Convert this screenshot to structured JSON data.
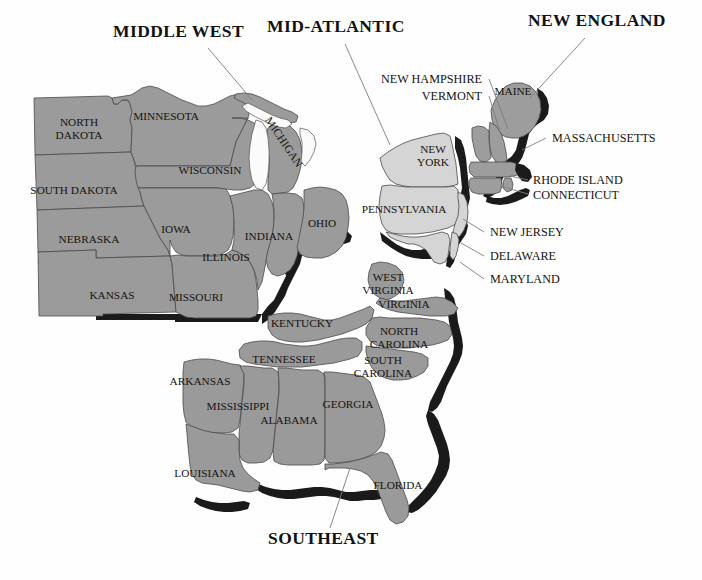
{
  "map": {
    "title_font_note": "serif bold uppercase",
    "background_color": "#fefefe",
    "region_fill_colors": {
      "middle_west": "#9b9b9b",
      "mid_atlantic": "#d5d5d5",
      "new_england": "#9d9d9d",
      "southeast": "#9a9a9a",
      "drop_shadow": "#1a1a1a",
      "great_lakes": "#fbfbfb",
      "border_stroke": "#4a4a4a"
    },
    "regions": [
      {
        "id": "middle-west",
        "label": "MIDDLE WEST",
        "x": 113,
        "y": 37,
        "anchor": "start"
      },
      {
        "id": "mid-atlantic",
        "label": "MID-ATLANTIC",
        "x": 267,
        "y": 32,
        "anchor": "start"
      },
      {
        "id": "new-england",
        "label": "NEW ENGLAND",
        "x": 528,
        "y": 26,
        "anchor": "start"
      },
      {
        "id": "southeast",
        "label": "SOUTHEAST",
        "x": 268,
        "y": 544,
        "anchor": "start"
      }
    ],
    "region_leaders": [
      {
        "id": "leader-middle-west",
        "x1": 208,
        "y1": 48,
        "x2": 252,
        "y2": 100
      },
      {
        "id": "leader-mid-atlantic",
        "x1": 345,
        "y1": 44,
        "x2": 390,
        "y2": 145
      },
      {
        "id": "leader-new-england",
        "x1": 585,
        "y1": 38,
        "x2": 530,
        "y2": 98
      },
      {
        "id": "leader-southeast",
        "x1": 330,
        "y1": 528,
        "x2": 350,
        "y2": 468
      }
    ],
    "state_labels": [
      {
        "id": "north-dakota",
        "lines": [
          "NORTH",
          "DAKOTA"
        ],
        "x": 79,
        "y": 126
      },
      {
        "id": "south-dakota",
        "lines": [
          "SOUTH DAKOTA"
        ],
        "x": 74,
        "y": 194
      },
      {
        "id": "nebraska",
        "lines": [
          "NEBRASKA"
        ],
        "x": 89,
        "y": 243
      },
      {
        "id": "kansas",
        "lines": [
          "KANSAS"
        ],
        "x": 112,
        "y": 299
      },
      {
        "id": "minnesota",
        "lines": [
          "MINNESOTA"
        ],
        "x": 166,
        "y": 120
      },
      {
        "id": "wisconsin",
        "lines": [
          "WISCONSIN"
        ],
        "x": 210,
        "y": 174
      },
      {
        "id": "iowa",
        "lines": [
          "IOWA"
        ],
        "x": 176,
        "y": 233
      },
      {
        "id": "missouri",
        "lines": [
          "MISSOURI"
        ],
        "x": 196,
        "y": 301
      },
      {
        "id": "illinois",
        "lines": [
          "ILLINOIS"
        ],
        "x": 226,
        "y": 261
      },
      {
        "id": "indiana",
        "lines": [
          "INDIANA"
        ],
        "x": 269,
        "y": 240
      },
      {
        "id": "ohio",
        "lines": [
          "OHIO"
        ],
        "x": 322,
        "y": 227
      },
      {
        "id": "michigan",
        "lines": [
          "MICHIGAN"
        ],
        "x": 281,
        "y": 144,
        "rotate": 56
      },
      {
        "id": "new-york",
        "lines": [
          "NEW",
          "YORK"
        ],
        "x": 433,
        "y": 153
      },
      {
        "id": "pennsylvania",
        "lines": [
          "PENNSYLVANIA"
        ],
        "x": 404,
        "y": 213
      },
      {
        "id": "maine",
        "lines": [
          "MAINE"
        ],
        "x": 513,
        "y": 95
      },
      {
        "id": "west-virginia",
        "lines": [
          "WEST",
          "VIRGINIA"
        ],
        "x": 388,
        "y": 281
      },
      {
        "id": "virginia",
        "lines": [
          "VIRGINIA"
        ],
        "x": 404,
        "y": 308
      },
      {
        "id": "kentucky",
        "lines": [
          "KENTUCKY"
        ],
        "x": 302,
        "y": 327
      },
      {
        "id": "north-carolina",
        "lines": [
          "NORTH",
          "CAROLINA"
        ],
        "x": 399,
        "y": 335
      },
      {
        "id": "tennessee",
        "lines": [
          "TENNESSEE"
        ],
        "x": 284,
        "y": 363
      },
      {
        "id": "south-carolina",
        "lines": [
          "SOUTH",
          "CAROLINA"
        ],
        "x": 383,
        "y": 364
      },
      {
        "id": "arkansas",
        "lines": [
          "ARKANSAS"
        ],
        "x": 200,
        "y": 385
      },
      {
        "id": "mississippi",
        "lines": [
          "MISSISSIPPI"
        ],
        "x": 238,
        "y": 410
      },
      {
        "id": "alabama",
        "lines": [
          "ALABAMA"
        ],
        "x": 289,
        "y": 424
      },
      {
        "id": "georgia",
        "lines": [
          "GEORGIA"
        ],
        "x": 348,
        "y": 408
      },
      {
        "id": "louisiana",
        "lines": [
          "LOUISIANA"
        ],
        "x": 205,
        "y": 477
      },
      {
        "id": "florida",
        "lines": [
          "FLORIDA"
        ],
        "x": 398,
        "y": 489
      }
    ],
    "callouts": [
      {
        "id": "new-hampshire",
        "label": "NEW HAMPSHIRE",
        "x": 482,
        "y": 83,
        "anchor": "end",
        "leader": {
          "x1": 489,
          "y1": 79,
          "x2": 508,
          "y2": 129
        }
      },
      {
        "id": "vermont",
        "label": "VERMONT",
        "x": 482,
        "y": 100,
        "anchor": "end",
        "leader": {
          "x1": 489,
          "y1": 96,
          "x2": 500,
          "y2": 132
        }
      },
      {
        "id": "massachusetts",
        "label": "MASSACHUSETTS",
        "x": 552,
        "y": 142,
        "anchor": "start",
        "leader": {
          "x1": 546,
          "y1": 138,
          "x2": 522,
          "y2": 150
        }
      },
      {
        "id": "rhode-island",
        "label": "RHODE ISLAND",
        "x": 533,
        "y": 184,
        "anchor": "start",
        "leader": {
          "x1": 528,
          "y1": 180,
          "x2": 510,
          "y2": 176
        }
      },
      {
        "id": "connecticut",
        "label": "CONNECTICUT",
        "x": 533,
        "y": 199,
        "anchor": "start",
        "leader": {
          "x1": 528,
          "y1": 194,
          "x2": 500,
          "y2": 186
        }
      },
      {
        "id": "new-jersey",
        "label": "NEW JERSEY",
        "x": 490,
        "y": 236,
        "anchor": "start",
        "leader": {
          "x1": 484,
          "y1": 232,
          "x2": 463,
          "y2": 219
        }
      },
      {
        "id": "delaware",
        "label": "DELAWARE",
        "x": 490,
        "y": 260,
        "anchor": "start",
        "leader": {
          "x1": 484,
          "y1": 256,
          "x2": 461,
          "y2": 243
        }
      },
      {
        "id": "maryland",
        "label": "MARYLAND",
        "x": 490,
        "y": 283,
        "anchor": "start",
        "leader": {
          "x1": 484,
          "y1": 279,
          "x2": 460,
          "y2": 262
        }
      }
    ]
  }
}
